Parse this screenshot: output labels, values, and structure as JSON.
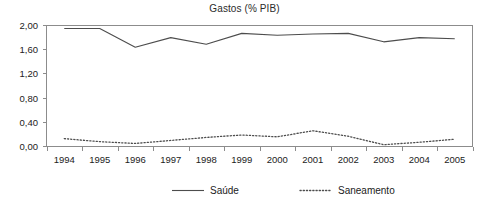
{
  "chart_data": {
    "type": "line",
    "title": "Gastos (% PIB)",
    "xlabel": "",
    "ylabel": "",
    "categories": [
      "1994",
      "1995",
      "1996",
      "1997",
      "1998",
      "1999",
      "2000",
      "2001",
      "2002",
      "2003",
      "2004",
      "2005"
    ],
    "series": [
      {
        "name": "Saúde",
        "style": "solid",
        "color": "#4d4d4d",
        "values": [
          1.95,
          1.95,
          1.64,
          1.8,
          1.69,
          1.87,
          1.84,
          1.86,
          1.87,
          1.73,
          1.8,
          1.78
        ]
      },
      {
        "name": "Saneamento",
        "style": "dotted",
        "color": "#4d4d4d",
        "values": [
          0.13,
          0.08,
          0.05,
          0.1,
          0.15,
          0.19,
          0.16,
          0.26,
          0.17,
          0.03,
          0.07,
          0.12
        ]
      }
    ],
    "ylim": [
      0.0,
      2.0
    ],
    "yticks": [
      0.0,
      0.4,
      0.8,
      1.2,
      1.6,
      2.0
    ],
    "ytick_labels": [
      "0,00",
      "0,40",
      "0,80",
      "1,20",
      "1,60",
      "2,00"
    ],
    "grid": false,
    "legend_position": "bottom",
    "legend": [
      {
        "label": "Saúde",
        "style": "solid"
      },
      {
        "label": "Saneamento",
        "style": "dotted"
      }
    ],
    "axis_color": "#8c8c8c",
    "text_color": "#222222",
    "background": "#ffffff"
  }
}
